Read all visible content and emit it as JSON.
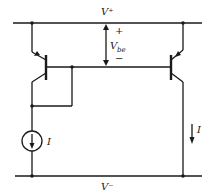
{
  "diagram": {
    "labels": {
      "supply_positive": "V⁺",
      "supply_negative": "V⁻",
      "vbe_main": "V",
      "vbe_sub": "be",
      "vbe_plus": "+",
      "vbe_minus": "−",
      "reference_current": "I",
      "output_current": "I"
    },
    "components": [
      {
        "type": "pnp-transistor",
        "role": "reference (diode-connected)"
      },
      {
        "type": "pnp-transistor",
        "role": "output"
      },
      {
        "type": "current-source",
        "label": "I"
      }
    ],
    "colors": {
      "ink": "#1a1a1a",
      "background": "#ffffff"
    }
  }
}
